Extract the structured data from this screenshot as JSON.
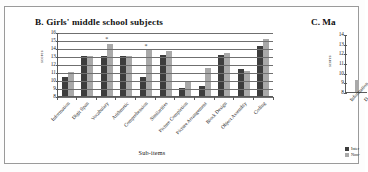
{
  "figure": {
    "background": "#ffffff",
    "bar_color_dark": "#3d3d3d",
    "bar_color_light": "#a9a9a9"
  },
  "panel_b": {
    "title": "B. Girls' middle school subjects",
    "xlabel": "Sub-items",
    "ylabel": "scores"
  },
  "panel_c": {
    "title": "C. Ma",
    "ylabel": "scores",
    "cat_first": "Information",
    "cat_second": "D",
    "legend": [
      {
        "label": "Inter"
      },
      {
        "label": "Non-"
      }
    ],
    "yticks": [
      "14",
      "13",
      "12",
      "11",
      "10",
      "9",
      "8"
    ]
  },
  "chart_data": [
    {
      "id": "panel-b",
      "type": "bar",
      "title": "B. Girls' middle school subjects",
      "xlabel": "Sub-items",
      "ylabel": "scores",
      "ylim": [
        8,
        16
      ],
      "yticks": [
        8,
        9,
        10,
        11,
        12,
        13,
        14,
        15,
        16
      ],
      "grid": true,
      "legend_position": "none",
      "categories": [
        "Information",
        "Digit Span",
        "Vocabulary",
        "Arithmetic",
        "Comprehension",
        "Similarities",
        "Picture Completion",
        "Picture Arrangement",
        "Block Design",
        "Object Assembly",
        "Coding"
      ],
      "series": [
        {
          "name": "Intervention",
          "color": "#3d3d3d",
          "values": [
            10.4,
            13.0,
            13.0,
            13.0,
            10.4,
            13.15,
            8.95,
            9.25,
            13.15,
            11.4,
            14.2
          ]
        },
        {
          "name": "Non-intervention",
          "color": "#a9a9a9",
          "values": [
            11.0,
            13.0,
            14.45,
            13.0,
            13.85,
            13.6,
            9.85,
            11.5,
            13.4,
            11.1,
            15.15
          ]
        }
      ],
      "annotations": [
        {
          "text": "*",
          "category": "Vocabulary",
          "y": 15.3
        },
        {
          "text": "*",
          "category": "Comprehension",
          "y": 14.35
        }
      ]
    },
    {
      "id": "panel-c",
      "type": "bar",
      "title": "C. Ma",
      "ylabel": "scores",
      "ylim": [
        8,
        14
      ],
      "yticks": [
        8,
        9,
        10,
        11,
        12,
        13,
        14
      ],
      "grid": false,
      "cropped": true,
      "legend_position": "bottom-left",
      "categories": [
        "Information"
      ],
      "series": [
        {
          "name": "Inter",
          "color": "#3d3d3d",
          "values": [
            8.0
          ]
        },
        {
          "name": "Non-",
          "color": "#a9a9a9",
          "values": [
            9.2
          ]
        }
      ]
    }
  ]
}
